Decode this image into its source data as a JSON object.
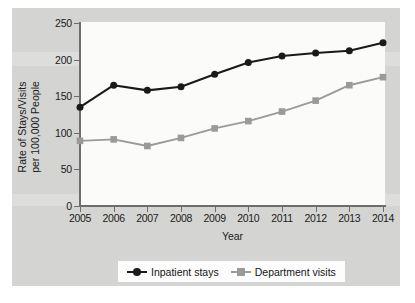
{
  "chart_data": {
    "type": "line",
    "title": "",
    "xlabel": "Year",
    "ylabel": "Rate of Stays/Visits per 100,000 People",
    "ylabel_line1": "Rate of Stays/Visits",
    "ylabel_line2": "per 100,000 People",
    "categories": [
      "2005",
      "2006",
      "2007",
      "2008",
      "2009",
      "2010",
      "2011",
      "2012",
      "2013",
      "2014"
    ],
    "x": [
      2005,
      2006,
      2007,
      2008,
      2009,
      2010,
      2011,
      2012,
      2013,
      2014
    ],
    "ylim": [
      0,
      250
    ],
    "xlim": [
      2005,
      2014
    ],
    "yticks": [
      "0",
      "50",
      "100",
      "150",
      "200",
      "250"
    ],
    "ytick_values": [
      0,
      50,
      100,
      150,
      200,
      250
    ],
    "grid": false,
    "legend_position": "bottom",
    "series": [
      {
        "name": "Inpatient stays",
        "marker": "circle",
        "color": "#1a1a1a",
        "values": [
          135,
          165,
          158,
          163,
          180,
          196,
          205,
          209,
          212,
          223
        ]
      },
      {
        "name": "Department visits",
        "marker": "square",
        "color": "#9a9a9a",
        "values": [
          89,
          91,
          82,
          93,
          106,
          116,
          129,
          144,
          165,
          176
        ]
      }
    ]
  },
  "legend": {
    "items": [
      {
        "label": "Inpatient stays",
        "marker": "circle-marker",
        "color": "#1a1a1a"
      },
      {
        "label": "Department visits",
        "marker": "square-marker",
        "color": "#9a9a9a"
      }
    ]
  },
  "colors": {
    "panel_background": "#d4d4d2",
    "plot_background": "#fbfbfa",
    "axis": "#6d6d6d",
    "series_1": "#1a1a1a",
    "series_2": "#9a9a9a",
    "text": "#1b1b1b"
  }
}
